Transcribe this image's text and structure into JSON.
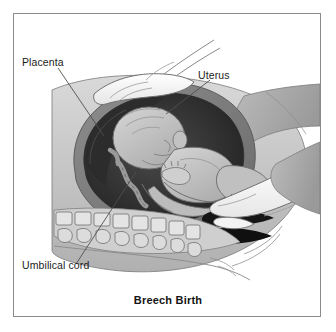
{
  "figure": {
    "title": "Breech Birth",
    "labels": [
      {
        "id": "placenta",
        "text": "Placenta"
      },
      {
        "id": "uterus",
        "text": "Uterus"
      },
      {
        "id": "umbilical_cord",
        "text": "Umbilical cord"
      }
    ],
    "colors": {
      "frame_border": "#8a8a8a",
      "background": "#ffffff",
      "text": "#1c1c1c",
      "leader_line": "#555555",
      "tissue_light": "#d8d8d8",
      "tissue_mid": "#b3b3b3",
      "tissue_dark": "#8f8f8f",
      "uterine_wall": "#6e6e6e",
      "cavity_dark": "#3a3a3a",
      "cavity_darkest": "#1e1e1e",
      "fetus_body": "#c9c9c9",
      "fetus_shade": "#a8a8a8",
      "hand_light": "#fbfbfb",
      "bone_light": "#e2e2e2",
      "outline": "#6a6a6a"
    },
    "elements": [
      "clinician-hand-upper",
      "clinician-hand-lower",
      "uterus-wall",
      "placenta",
      "fetus-breech-position",
      "umbilical-cord",
      "maternal-spine-vertebrae",
      "birth-canal"
    ]
  }
}
